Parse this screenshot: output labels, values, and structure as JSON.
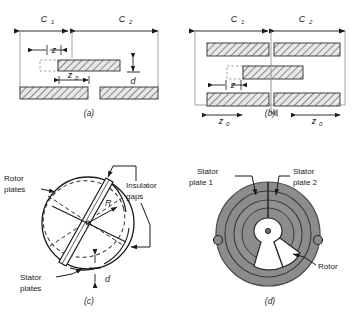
{
  "figure": {
    "name": "variable-capacitor-configurations",
    "background": "#ffffff",
    "hatch_fill": "#e8e8e8",
    "hatch_line": "#3a3a3a",
    "disk_gray": "#8c8c8c",
    "disk_gray_dark": "#777777",
    "rotor_white": "#ffffff",
    "line_color": "#1a1a1a"
  },
  "panels": [
    {
      "id": "a",
      "caption": "(a)",
      "labels": {
        "c1": "C",
        "c1_sub": "1",
        "c2": "C",
        "c2_sub": "2",
        "z": "z",
        "z0": "z",
        "z0_sub": "0",
        "d": "d"
      }
    },
    {
      "id": "b",
      "caption": "(b)",
      "labels": {
        "c1": "C",
        "c1_sub": "1",
        "c2": "C",
        "c2_sub": "2",
        "z": "z",
        "z0_left": "z",
        "z0_left_sub": "0",
        "z0_right": "z",
        "z0_right_sub": "0"
      }
    },
    {
      "id": "c",
      "caption": "(c)",
      "labels": {
        "rotor_plates_1": "Rotor",
        "rotor_plates_2": "plates",
        "insulator_gaps_1": "Insulator",
        "insulator_gaps_2": "gaps",
        "stator_plates_1": "Stator",
        "stator_plates_2": "plates",
        "radius": "R",
        "gap": "d"
      }
    },
    {
      "id": "d",
      "caption": "(d)",
      "labels": {
        "stator_plate_1_line1": "Stator",
        "stator_plate_1_line2": "plate 1",
        "stator_plate_2_line1": "Stator",
        "stator_plate_2_line2": "plate 2",
        "rotor": "Rotor"
      }
    }
  ]
}
